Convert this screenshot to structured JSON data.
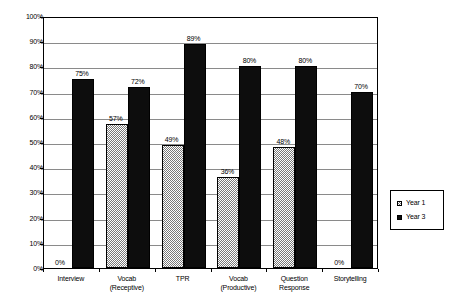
{
  "chart_data": {
    "type": "bar",
    "title": "",
    "subtitle": "",
    "xlabel": "",
    "ylabel": "",
    "ylim": [
      0,
      100
    ],
    "ytick_labels": [
      "0%",
      "10%",
      "20%",
      "30%",
      "40%",
      "50%",
      "60%",
      "70%",
      "80%",
      "90%",
      "100%"
    ],
    "ytick_values": [
      0,
      10,
      20,
      30,
      40,
      50,
      60,
      70,
      80,
      90,
      100
    ],
    "grid": true,
    "legend_position": "right",
    "categories": [
      "Interview",
      "Vocab\n(Receptive)",
      "TPR",
      "Vocab\n(Productive)",
      "Question\nResponse",
      "Storytelling"
    ],
    "category_lines": [
      [
        "Interview",
        ""
      ],
      [
        "Vocab",
        "(Receptive)"
      ],
      [
        "TPR",
        ""
      ],
      [
        "Vocab",
        "(Productive)"
      ],
      [
        "Question",
        "Response"
      ],
      [
        "Storytelling",
        ""
      ]
    ],
    "series": [
      {
        "name": "Year 1",
        "color": "#7a7a7a",
        "pattern": "checker",
        "values": [
          0,
          57,
          49,
          36,
          48,
          0
        ],
        "labels": [
          "0%",
          "57%",
          "49%",
          "36%",
          "48%",
          "0%"
        ]
      },
      {
        "name": "Year 3",
        "color": "#0d0d0d",
        "pattern": "solid",
        "values": [
          75,
          72,
          89,
          80,
          80,
          70
        ],
        "labels": [
          "75%",
          "72%",
          "89%",
          "80%",
          "80%",
          "70%"
        ]
      }
    ]
  },
  "legend": {
    "entries": [
      {
        "label": "Year 1"
      },
      {
        "label": "Year 3"
      }
    ]
  }
}
